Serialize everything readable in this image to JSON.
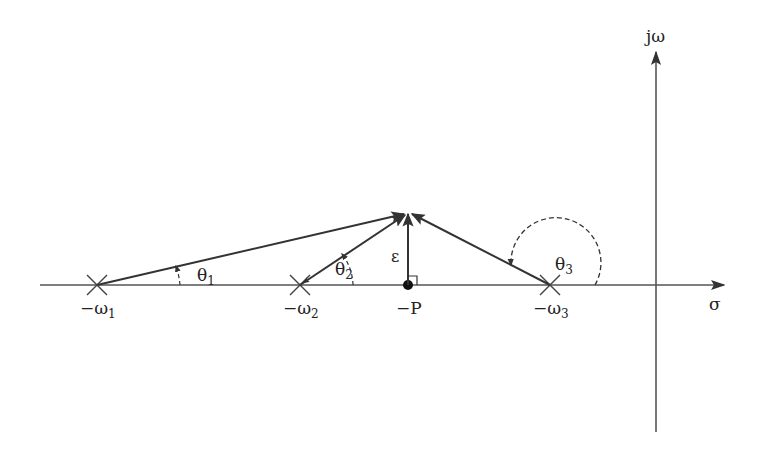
{
  "diagram": {
    "type": "s-plane pole-zero angle diagram",
    "axes": {
      "horizontal_label": "σ",
      "vertical_label": "jω"
    },
    "points": {
      "pole1": {
        "label": "−ω",
        "subscript": "1",
        "marker": "x"
      },
      "pole2": {
        "label": "−ω",
        "subscript": "2",
        "marker": "x"
      },
      "zero_p": {
        "label": "−P",
        "marker": "dot"
      },
      "pole3": {
        "label": "−ω",
        "subscript": "3",
        "marker": "x"
      }
    },
    "angles": {
      "theta1": {
        "label": "θ",
        "subscript": "1"
      },
      "theta2": {
        "label": "θ",
        "subscript": "2"
      },
      "theta3": {
        "label": "θ",
        "subscript": "3"
      }
    },
    "epsilon_label": "ε",
    "colors": {
      "line": "#333333",
      "axis": "#444444",
      "background": "#ffffff"
    }
  }
}
